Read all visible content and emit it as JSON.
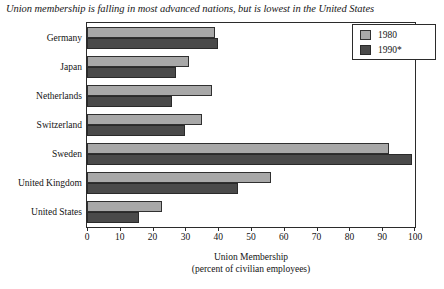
{
  "chart_data": {
    "type": "bar",
    "orientation": "horizontal",
    "title": "Union membership is falling in most advanced nations, but is lowest in the United States",
    "xlabel": "Union Membership",
    "xlabel_sub": "(percent of civilian employees)",
    "ylabel": "",
    "xlim": [
      0,
      100
    ],
    "xticks": [
      0,
      10,
      20,
      30,
      40,
      50,
      60,
      70,
      80,
      90,
      100
    ],
    "grid": false,
    "legend_position": "top-right",
    "categories": [
      "Germany",
      "Japan",
      "Netherlands",
      "Switzerland",
      "Sweden",
      "United Kingdom",
      "United States"
    ],
    "series": [
      {
        "name": "1980",
        "color": "#a8a8a8",
        "values": [
          39,
          31,
          38,
          35,
          92,
          56,
          23
        ]
      },
      {
        "name": "1990*",
        "color": "#4a4a4a",
        "values": [
          40,
          27,
          26,
          30,
          99,
          46,
          16
        ]
      }
    ]
  },
  "legend": {
    "entries": [
      {
        "label": "1980"
      },
      {
        "label": "1990*"
      }
    ]
  }
}
